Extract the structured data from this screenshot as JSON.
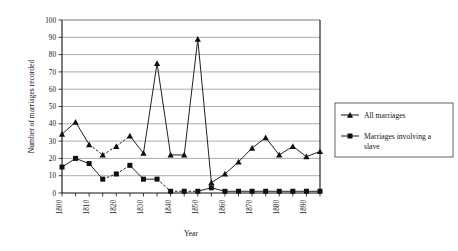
{
  "chart_data": {
    "type": "line",
    "title": "",
    "xlabel": "Year",
    "ylabel": "Number of marriages recorded",
    "ylim": [
      0,
      100
    ],
    "xlim": [
      1800,
      1895
    ],
    "ytick_step": 10,
    "yticks": [
      0,
      10,
      20,
      30,
      40,
      50,
      60,
      70,
      80,
      90,
      100
    ],
    "ytick_labels": [
      "0",
      "10",
      "20",
      "30",
      "40",
      "50",
      "60",
      "70",
      "80",
      "90",
      "100"
    ],
    "x": [
      1800,
      1805,
      1810,
      1815,
      1820,
      1825,
      1830,
      1835,
      1840,
      1845,
      1850,
      1855,
      1860,
      1865,
      1870,
      1875,
      1880,
      1885,
      1890,
      1895
    ],
    "xtick_labels": [
      "1800",
      "",
      "1810",
      "",
      "1820",
      "",
      "1830",
      "",
      "1840",
      "",
      "1850",
      "",
      "1860",
      "",
      "1870",
      "",
      "1880",
      "",
      "1890",
      ""
    ],
    "xtick_labels_shown": [
      "1800",
      "1810",
      "1820",
      "1830",
      "1840",
      "1850",
      "1860",
      "1870",
      "1880",
      "1890"
    ],
    "grid": "horizontal",
    "legend_position": "right",
    "series": [
      {
        "name": "All marriages",
        "marker": "triangle",
        "values": [
          34,
          41,
          28,
          22,
          27,
          33,
          23,
          75,
          22,
          22,
          89,
          6,
          11,
          18,
          26,
          32,
          22,
          27,
          21,
          24
        ],
        "dashed_segments": [
          [
            2,
            3
          ],
          [
            3,
            4
          ],
          [
            4,
            5
          ]
        ]
      },
      {
        "name": "Marriages involving a slave",
        "marker": "square",
        "values": [
          15,
          20,
          17,
          8,
          11,
          16,
          8,
          8,
          1,
          1,
          1,
          3,
          1,
          1,
          1,
          1,
          1,
          1,
          1,
          1
        ],
        "dashed_segments": [
          [
            3,
            4
          ],
          [
            4,
            5
          ],
          [
            7,
            8
          ],
          [
            8,
            9
          ],
          [
            9,
            10
          ]
        ]
      }
    ],
    "legend": [
      {
        "label": "All marriages",
        "marker": "triangle"
      },
      {
        "label": "Marriages involving a slave",
        "marker": "square"
      }
    ]
  },
  "legend": {
    "item_0": "All marriages",
    "item_1_line_0": "Marriages involving a",
    "item_1_line_1": "slave"
  },
  "axes": {
    "x_title": "Year",
    "y_title": "Number of marriages recorded"
  }
}
